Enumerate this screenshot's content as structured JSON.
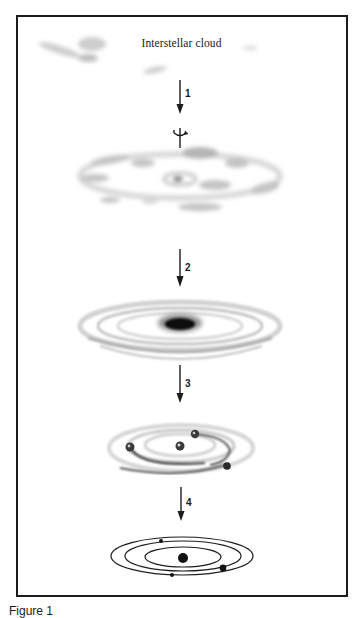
{
  "figure": {
    "title": "Interstellar cloud",
    "caption": "Figure 1",
    "stages": [
      {
        "id": "stage-0",
        "description": "Interstellar cloud"
      },
      {
        "id": "stage-1",
        "description": "Rotating fragmented cloud collapsing"
      },
      {
        "id": "stage-2",
        "description": "Flattened disk with dense central core"
      },
      {
        "id": "stage-3",
        "description": "Protoplanets forming in rings around protosun"
      },
      {
        "id": "stage-4",
        "description": "Planetary system with orbits around sun"
      }
    ],
    "steps": [
      {
        "label": "1"
      },
      {
        "label": "2"
      },
      {
        "label": "3"
      },
      {
        "label": "4"
      }
    ],
    "icons": {
      "rotation": "rotation-axis-icon",
      "arrow": "down-arrow-icon"
    },
    "colors": {
      "ink": "#1c1c1c",
      "cloud": "#b8b8b8",
      "background": "#ffffff"
    }
  }
}
